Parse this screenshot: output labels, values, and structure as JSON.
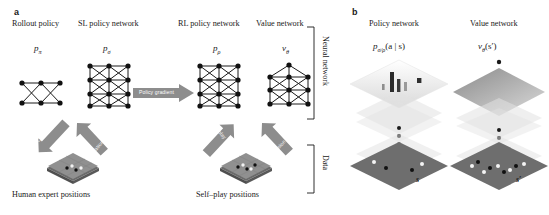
{
  "figure": {
    "panels": [
      {
        "letter": "a"
      },
      {
        "letter": "b"
      }
    ]
  },
  "panel_a": {
    "letter": "a",
    "columns": [
      {
        "title": "Rollout policy",
        "symbol_base": "p",
        "symbol_sub": "π"
      },
      {
        "title": "SL policy network",
        "symbol_base": "p",
        "symbol_sub": "σ"
      },
      {
        "title": "RL policy network",
        "symbol_base": "p",
        "symbol_sub": "ρ"
      },
      {
        "title": "Value network",
        "symbol_base": "v",
        "symbol_sub": "θ"
      }
    ],
    "policy_gradient_label": "Policy gradient",
    "arrows": [
      {
        "label": "Classification"
      },
      {
        "label": "Classification"
      },
      {
        "label": "Self play"
      },
      {
        "label": "Regression"
      }
    ],
    "data_sources": [
      {
        "label": "Human expert positions"
      },
      {
        "label": "Self–play positions"
      }
    ],
    "brackets": [
      {
        "label": "Neural network"
      },
      {
        "label": "Data"
      }
    ]
  },
  "panel_b": {
    "letter": "b",
    "columns": [
      {
        "title": "Policy network",
        "formula_base": "p",
        "formula_sub": "σ/ρ",
        "formula_args": "(a | s)",
        "state_label": "s"
      },
      {
        "title": "Value network",
        "formula_base": "v",
        "formula_sub": "θ",
        "formula_args": "(s′)",
        "state_label": "s′"
      }
    ]
  },
  "colors": {
    "ink": "#1a1a1a",
    "arrow_grey": "#8d8d8d",
    "arrow_grey_dark": "#6f6f6f",
    "board_grey": "#8f8f8f",
    "board_grey_dark": "#6a6a6a",
    "layer_grey": "#bdbdbd",
    "background": "#ffffff"
  }
}
